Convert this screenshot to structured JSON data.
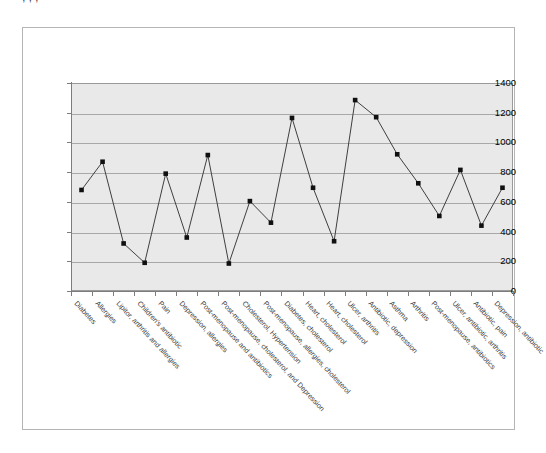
{
  "page": {
    "clipped_top_text": "· · , , ,",
    "background_color": "#ffffff",
    "frame_border_color": "#b5b5b5"
  },
  "chart_data": {
    "type": "line",
    "title": "",
    "subtitle": "",
    "xlabel": "",
    "ylabel": "",
    "ylim": [
      0,
      1400
    ],
    "ytick_step": 200,
    "yticks": [
      1400,
      1200,
      1000,
      800,
      600,
      400,
      200,
      0
    ],
    "grid": true,
    "grid_axis": "y",
    "legend": false,
    "legend_position": "none",
    "plot_background": "#e9e9e9",
    "series_color": "#3f3f3f",
    "marker_color": "#101010",
    "marker": "square",
    "categories": [
      "Diabetes",
      "Allergies",
      "Lipitor, arthritis and allergies",
      "Children's antibiotic",
      "Pain",
      "Depression, allergies",
      "Post-menopause and antibiotics",
      "Post-menopause, cholesterol, and Depression",
      "Cholesterol, Hypertension",
      "Post-menopause, allergies, cholesterol",
      "Diabetes, cholesterol",
      "Heart, cholesterol",
      "Heart, cholesterol",
      "Ulcer, arthritis",
      "Antibiotic, depression",
      "Asthma",
      "Arthritis",
      "Post-menopause, antibiotics",
      "Ulcer, antibiotic, arthritis",
      "Antibiotic, pain",
      "Depression, antibiotic"
    ],
    "values": [
      680,
      870,
      320,
      190,
      790,
      360,
      915,
      185,
      605,
      460,
      1165,
      695,
      335,
      1285,
      1170,
      920,
      725,
      505,
      815,
      440,
      695
    ],
    "series": [
      {
        "name": "Series1",
        "values": [
          680,
          870,
          320,
          190,
          790,
          360,
          915,
          185,
          605,
          460,
          1165,
          695,
          335,
          1285,
          1170,
          920,
          725,
          505,
          815,
          440,
          695
        ]
      }
    ]
  }
}
